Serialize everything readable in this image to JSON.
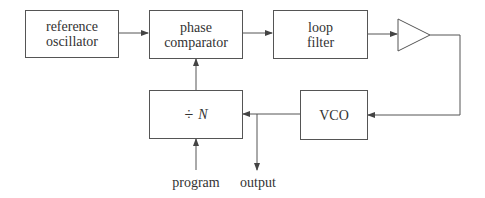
{
  "diagram": {
    "type": "phase-locked loop frequency synthesizer block diagram",
    "blocks": {
      "reference_oscillator": {
        "line1": "reference",
        "line2": "oscillator"
      },
      "phase_comparator": {
        "line1": "phase",
        "line2": "comparator"
      },
      "loop_filter": {
        "line1": "loop",
        "line2": "filter"
      },
      "amplifier": {
        "shape": "triangle"
      },
      "vco": {
        "label": "VCO"
      },
      "divider": {
        "symbol": "÷",
        "variable": "N"
      }
    },
    "io_labels": {
      "program": "program",
      "output": "output"
    },
    "connections": [
      {
        "from": "reference oscillator",
        "to": "phase comparator"
      },
      {
        "from": "phase comparator",
        "to": "loop filter"
      },
      {
        "from": "loop filter",
        "to": "amplifier"
      },
      {
        "from": "amplifier",
        "to": "VCO"
      },
      {
        "from": "VCO",
        "to": "÷ N"
      },
      {
        "from": "VCO",
        "to": "output"
      },
      {
        "from": "÷ N",
        "to": "phase comparator"
      },
      {
        "from": "program",
        "to": "÷ N"
      }
    ],
    "colors": {
      "line": "#555555",
      "text": "#333333",
      "background": "#ffffff"
    }
  }
}
